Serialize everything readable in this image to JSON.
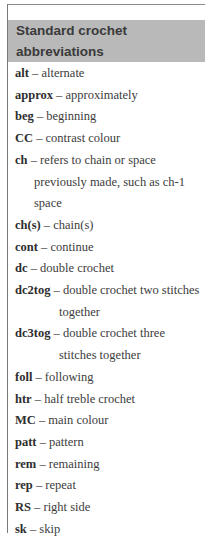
{
  "header": {
    "title": "Standard crochet abbreviations"
  },
  "entries": [
    {
      "abbr": "alt",
      "def": "alternate",
      "cont": []
    },
    {
      "abbr": "approx",
      "def": "approximately",
      "cont": []
    },
    {
      "abbr": "beg",
      "def": "beginning",
      "cont": []
    },
    {
      "abbr": "CC",
      "def": "contrast colour",
      "cont": []
    },
    {
      "abbr": "ch",
      "def": "refers to chain or space",
      "cont": [
        "previously made, such as ch-1",
        "space"
      ]
    },
    {
      "abbr": "ch(s)",
      "def": "chain(s)",
      "cont": []
    },
    {
      "abbr": "cont",
      "def": "continue",
      "cont": []
    },
    {
      "abbr": "dc",
      "def": "double crochet",
      "cont": []
    },
    {
      "abbr": "dc2tog",
      "def": "double crochet two stitches",
      "cont": [
        "together"
      ]
    },
    {
      "abbr": "dc3tog",
      "def": "double crochet three",
      "cont": [
        "stitches together"
      ]
    },
    {
      "abbr": "foll",
      "def": "following",
      "cont": []
    },
    {
      "abbr": "htr",
      "def": "half treble crochet",
      "cont": []
    },
    {
      "abbr": "MC",
      "def": "main colour",
      "cont": []
    },
    {
      "abbr": "patt",
      "def": "pattern",
      "cont": []
    },
    {
      "abbr": "rem",
      "def": "remaining",
      "cont": []
    },
    {
      "abbr": "rep",
      "def": "repeat",
      "cont": []
    },
    {
      "abbr": "RS",
      "def": "right side",
      "cont": []
    },
    {
      "abbr": "sk",
      "def": "skip",
      "cont": []
    }
  ],
  "separator": "–",
  "colors": {
    "header_bg": "#b9b9b9",
    "header_text": "#3a3a3a",
    "body_text": "#3c3c3c",
    "rule": "#7a7a7a"
  }
}
